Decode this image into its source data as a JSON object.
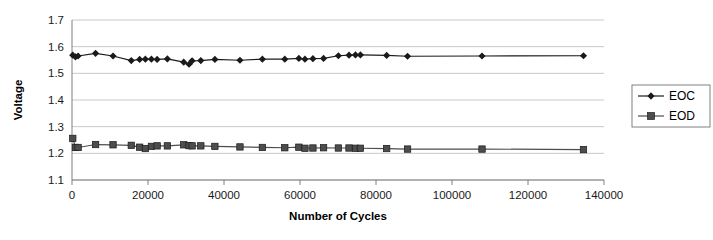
{
  "chart_data": {
    "type": "line",
    "title": "",
    "xlabel": "Number of Cycles",
    "ylabel": "Voltage",
    "xlim": [
      0,
      140000
    ],
    "ylim": [
      1.1,
      1.7
    ],
    "xticks": [
      0,
      20000,
      40000,
      60000,
      80000,
      100000,
      120000,
      140000
    ],
    "xtick_labels": [
      "0",
      "20000",
      "40000",
      "60000",
      "80000",
      "100000",
      "120000",
      "140000"
    ],
    "yticks": [
      1.1,
      1.2,
      1.3,
      1.4,
      1.5,
      1.6,
      1.7
    ],
    "ytick_labels": [
      "1.1",
      "1.2",
      "1.3",
      "1.4",
      "1.5",
      "1.6",
      "1.7"
    ],
    "grid": "horizontal",
    "legend_position": "right",
    "series": [
      {
        "name": "EOC",
        "marker": "diamond",
        "color": "#1a1a1a",
        "x": [
          200,
          900,
          1600,
          6200,
          10800,
          15600,
          17800,
          19300,
          20900,
          22400,
          25100,
          29400,
          30800,
          31600,
          33900,
          37600,
          44200,
          50100,
          56000,
          59700,
          61300,
          63400,
          66200,
          70100,
          72900,
          74600,
          75900,
          82800,
          88300,
          107900,
          134600
        ],
        "y": [
          1.568,
          1.562,
          1.565,
          1.575,
          1.565,
          1.548,
          1.552,
          1.553,
          1.553,
          1.552,
          1.554,
          1.542,
          1.534,
          1.547,
          1.548,
          1.552,
          1.549,
          1.553,
          1.553,
          1.556,
          1.553,
          1.555,
          1.556,
          1.566,
          1.568,
          1.569,
          1.569,
          1.567,
          1.564,
          1.565,
          1.566
        ]
      },
      {
        "name": "EOD",
        "marker": "square",
        "color": "#4d4d4d",
        "x": [
          200,
          900,
          1600,
          6200,
          10800,
          15600,
          17800,
          19300,
          20900,
          22400,
          25100,
          29400,
          30800,
          31600,
          33900,
          37600,
          44200,
          50100,
          56000,
          59700,
          61300,
          63400,
          66200,
          70100,
          72900,
          74600,
          75900,
          82800,
          88300,
          107900,
          134600
        ],
        "y": [
          1.256,
          1.222,
          1.222,
          1.233,
          1.232,
          1.23,
          1.223,
          1.218,
          1.226,
          1.228,
          1.228,
          1.232,
          1.229,
          1.228,
          1.228,
          1.226,
          1.224,
          1.222,
          1.221,
          1.223,
          1.219,
          1.22,
          1.221,
          1.22,
          1.22,
          1.219,
          1.219,
          1.218,
          1.216,
          1.216,
          1.214
        ]
      }
    ]
  },
  "legend": {
    "items": [
      {
        "label": "EOC"
      },
      {
        "label": "EOD"
      }
    ]
  }
}
